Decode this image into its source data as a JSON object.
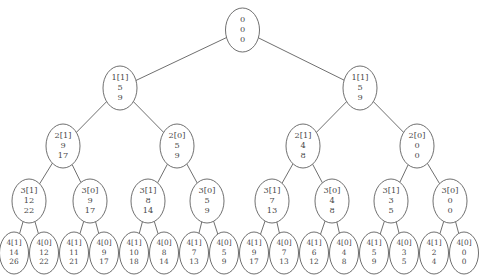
{
  "canvas": {
    "width": 485,
    "height": 280,
    "background": "#ffffff",
    "stroke_color": "#4a4a4a",
    "text_color": "#4a4a4a"
  },
  "header": {
    "clipped_text": "",
    "note": "row of text clipped off at top edge of screenshot"
  },
  "chart_data": {
    "type": "diagram",
    "diagram_type": "binary-tree",
    "title": "",
    "depth": 5,
    "node_label_format": "line1 = level[branch], line2 = value, line3 = value",
    "levels": [
      {
        "level": 0,
        "y": 30,
        "nodes": [
          {
            "id": "n0",
            "x": 242.5,
            "line1": "0",
            "line2": "0",
            "line3": "0"
          }
        ]
      },
      {
        "level": 1,
        "y": 88,
        "nodes": [
          {
            "id": "n1",
            "x": 120,
            "line1": "1[1]",
            "line2": "5",
            "line3": "9"
          },
          {
            "id": "n2",
            "x": 360,
            "line1": "1[1]",
            "line2": "5",
            "line3": "9"
          }
        ]
      },
      {
        "level": 2,
        "y": 146,
        "nodes": [
          {
            "id": "n3",
            "x": 63,
            "line1": "2[1]",
            "line2": "9",
            "line3": "17"
          },
          {
            "id": "n4",
            "x": 177,
            "line1": "2[0]",
            "line2": "5",
            "line3": "9"
          },
          {
            "id": "n5",
            "x": 303,
            "line1": "2[1]",
            "line2": "4",
            "line3": "8"
          },
          {
            "id": "n6",
            "x": 417,
            "line1": "2[0]",
            "line2": "0",
            "line3": "0"
          }
        ]
      },
      {
        "level": 3,
        "y": 201,
        "nodes": [
          {
            "id": "n7",
            "x": 29,
            "line1": "3[1]",
            "line2": "12",
            "line3": "22"
          },
          {
            "id": "n8",
            "x": 90,
            "line1": "3[0]",
            "line2": "9",
            "line3": "17"
          },
          {
            "id": "n9",
            "x": 148,
            "line1": "3[1]",
            "line2": "8",
            "line3": "14"
          },
          {
            "id": "n10",
            "x": 207,
            "line1": "3[0]",
            "line2": "5",
            "line3": "9"
          },
          {
            "id": "n11",
            "x": 272,
            "line1": "3[1]",
            "line2": "7",
            "line3": "13"
          },
          {
            "id": "n12",
            "x": 332,
            "line1": "3[0]",
            "line2": "4",
            "line3": "8"
          },
          {
            "id": "n13",
            "x": 391,
            "line1": "3[1]",
            "line2": "3",
            "line3": "5"
          },
          {
            "id": "n14",
            "x": 450,
            "line1": "3[0]",
            "line2": "0",
            "line3": "0"
          }
        ]
      },
      {
        "level": 4,
        "y": 253,
        "nodes": [
          {
            "id": "n15",
            "x": 14,
            "line1": "4[1]",
            "line2": "14",
            "line3": "26"
          },
          {
            "id": "n16",
            "x": 44,
            "line1": "4[0]",
            "line2": "12",
            "line3": "22"
          },
          {
            "id": "n17",
            "x": 74,
            "line1": "4[1]",
            "line2": "11",
            "line3": "21"
          },
          {
            "id": "n18",
            "x": 104,
            "line1": "4[0]",
            "line2": "9",
            "line3": "17"
          },
          {
            "id": "n19",
            "x": 134,
            "line1": "4[1]",
            "line2": "10",
            "line3": "18"
          },
          {
            "id": "n20",
            "x": 164,
            "line1": "4[0]",
            "line2": "8",
            "line3": "14"
          },
          {
            "id": "n21",
            "x": 194,
            "line1": "4[1]",
            "line2": "7",
            "line3": "13"
          },
          {
            "id": "n22",
            "x": 224,
            "line1": "4[0]",
            "line2": "5",
            "line3": "9"
          },
          {
            "id": "n23",
            "x": 254,
            "line1": "4[1]",
            "line2": "9",
            "line3": "17"
          },
          {
            "id": "n24",
            "x": 284,
            "line1": "4[0]",
            "line2": "7",
            "line3": "13"
          },
          {
            "id": "n25",
            "x": 314,
            "line1": "4[1]",
            "line2": "6",
            "line3": "12"
          },
          {
            "id": "n26",
            "x": 344,
            "line1": "4[0]",
            "line2": "4",
            "line3": "8"
          },
          {
            "id": "n27",
            "x": 374,
            "line1": "4[1]",
            "line2": "5",
            "line3": "9"
          },
          {
            "id": "n28",
            "x": 404,
            "line1": "4[0]",
            "line2": "3",
            "line3": "5"
          },
          {
            "id": "n29",
            "x": 434,
            "line1": "4[1]",
            "line2": "2",
            "line3": "4"
          },
          {
            "id": "n30",
            "x": 464,
            "line1": "4[0]",
            "line2": "0",
            "line3": "0"
          }
        ]
      }
    ],
    "edges": [
      {
        "from": "n0",
        "to": "n1"
      },
      {
        "from": "n0",
        "to": "n2"
      },
      {
        "from": "n1",
        "to": "n3"
      },
      {
        "from": "n1",
        "to": "n4"
      },
      {
        "from": "n2",
        "to": "n5"
      },
      {
        "from": "n2",
        "to": "n6"
      },
      {
        "from": "n3",
        "to": "n7"
      },
      {
        "from": "n3",
        "to": "n8"
      },
      {
        "from": "n4",
        "to": "n9"
      },
      {
        "from": "n4",
        "to": "n10"
      },
      {
        "from": "n5",
        "to": "n11"
      },
      {
        "from": "n5",
        "to": "n12"
      },
      {
        "from": "n6",
        "to": "n13"
      },
      {
        "from": "n6",
        "to": "n14"
      },
      {
        "from": "n7",
        "to": "n15"
      },
      {
        "from": "n7",
        "to": "n16"
      },
      {
        "from": "n8",
        "to": "n17"
      },
      {
        "from": "n8",
        "to": "n18"
      },
      {
        "from": "n9",
        "to": "n19"
      },
      {
        "from": "n9",
        "to": "n20"
      },
      {
        "from": "n10",
        "to": "n21"
      },
      {
        "from": "n10",
        "to": "n22"
      },
      {
        "from": "n11",
        "to": "n23"
      },
      {
        "from": "n11",
        "to": "n24"
      },
      {
        "from": "n12",
        "to": "n25"
      },
      {
        "from": "n12",
        "to": "n26"
      },
      {
        "from": "n13",
        "to": "n27"
      },
      {
        "from": "n13",
        "to": "n28"
      },
      {
        "from": "n14",
        "to": "n29"
      },
      {
        "from": "n14",
        "to": "n30"
      }
    ],
    "node_style": {
      "rx_upper": 17,
      "ry_upper": 22,
      "rx_leaf": 14.5,
      "ry_leaf": 21,
      "font_size_upper": 8.2,
      "font_size_leaf": 7.4,
      "line_gap_upper": 10,
      "line_gap_leaf": 9.5
    }
  }
}
